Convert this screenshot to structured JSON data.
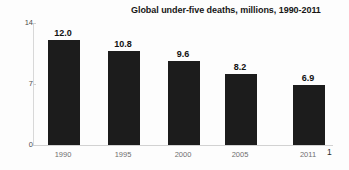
{
  "chart_data": {
    "type": "bar",
    "title": "Global under-five deaths, millions, 1990-2011",
    "categories": [
      "1990",
      "1995",
      "2000",
      "2005",
      "2011"
    ],
    "values": [
      12.0,
      10.8,
      9.6,
      8.2,
      6.9
    ],
    "value_labels": [
      "12.0",
      "10.8",
      "9.6",
      "8.2",
      "6.9"
    ],
    "xlabel": "",
    "ylabel": "",
    "ylim": [
      0,
      14
    ],
    "yticks": [
      0,
      7,
      14
    ],
    "ytick_labels": [
      "0",
      "7",
      "14"
    ],
    "grid": false,
    "legend": false,
    "bar_color": "#1c1c1c",
    "axis_color": "#d2d2d2",
    "tick_label_color": "#6f6f6f",
    "value_label_color": "#111111",
    "footnote_marker": "1"
  }
}
